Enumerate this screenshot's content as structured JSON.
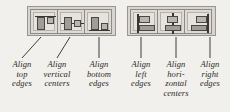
{
  "figure": {
    "background_color": "#f2f0ec",
    "toolbar_color": "#d8d5d0",
    "ink_color": "#2b2926"
  },
  "toolbars": [
    {
      "name": "align-vertical-toolbar",
      "buttons": [
        {
          "id": "align-top-edges",
          "icon": "align-top-edges-icon",
          "tooltip": "Align top edges"
        },
        {
          "id": "align-vertical-centers",
          "icon": "align-vertical-centers-icon",
          "tooltip": "Align vertical centers"
        },
        {
          "id": "align-bottom-edges",
          "icon": "align-bottom-edges-icon",
          "tooltip": "Align bottom edges"
        }
      ]
    },
    {
      "name": "align-horizontal-toolbar",
      "buttons": [
        {
          "id": "align-left-edges",
          "icon": "align-left-edges-icon",
          "tooltip": "Align left edges"
        },
        {
          "id": "align-horizontal-centers",
          "icon": "align-horizontal-centers-icon",
          "tooltip": "Align horizontal centers"
        },
        {
          "id": "align-right-edges",
          "icon": "align-right-edges-icon",
          "tooltip": "Align right edges"
        }
      ]
    }
  ],
  "captions": [
    {
      "id": "caption-align-top-edges",
      "lines": [
        "Align",
        "top",
        "edges"
      ]
    },
    {
      "id": "caption-align-vertical-centers",
      "lines": [
        "Align",
        "vertical",
        "centers"
      ]
    },
    {
      "id": "caption-align-bottom-edges",
      "lines": [
        "Align",
        "bottom",
        "edges"
      ]
    },
    {
      "id": "caption-align-left-edges",
      "lines": [
        "Align",
        "left",
        "edges"
      ]
    },
    {
      "id": "caption-align-horizontal-centers",
      "lines": [
        "Align",
        "hori-",
        "zontal",
        "centers"
      ]
    },
    {
      "id": "caption-align-right-edges",
      "lines": [
        "Align",
        "right",
        "edges"
      ]
    }
  ],
  "caption_text": {
    "c0l0": "Align",
    "c0l1": "top",
    "c0l2": "edges",
    "c1l0": "Align",
    "c1l1": "vertical",
    "c1l2": "centers",
    "c2l0": "Align",
    "c2l1": "bottom",
    "c2l2": "edges",
    "c3l0": "Align",
    "c3l1": "left",
    "c3l2": "edges",
    "c4l0": "Align",
    "c4l1": "hori-",
    "c4l2": "zontal",
    "c4l3": "centers",
    "c5l0": "Align",
    "c5l1": "right",
    "c5l2": "edges"
  }
}
